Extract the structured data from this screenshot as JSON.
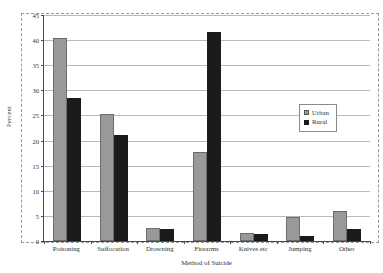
{
  "chart_data": {
    "type": "bar",
    "title": "",
    "xlabel": "Method of Suicide",
    "ylabel": "Percent",
    "ylim": [
      0,
      45
    ],
    "ytick_step": 5,
    "yticks": [
      0,
      5,
      10,
      15,
      20,
      25,
      30,
      35,
      40,
      45
    ],
    "grid": true,
    "legend_position": "right-middle",
    "categories": [
      "Poisoning",
      "Suffocation",
      "Drowning",
      "Firearms",
      "Knives etc",
      "Jumping",
      "Other"
    ],
    "series": [
      {
        "name": "Urban",
        "color": "#999999",
        "values": [
          40.5,
          25.2,
          2.5,
          17.7,
          1.6,
          4.8,
          5.9
        ]
      },
      {
        "name": "Rural",
        "color": "#1b1b1b",
        "values": [
          28.5,
          21.2,
          2.4,
          41.6,
          1.3,
          1.0,
          2.3
        ]
      }
    ]
  },
  "legend": {
    "entries": [
      {
        "label": "Urban"
      },
      {
        "label": "Rural"
      }
    ]
  },
  "axes": {
    "y_title": "Percent",
    "x_title": "Method of Suicide"
  }
}
